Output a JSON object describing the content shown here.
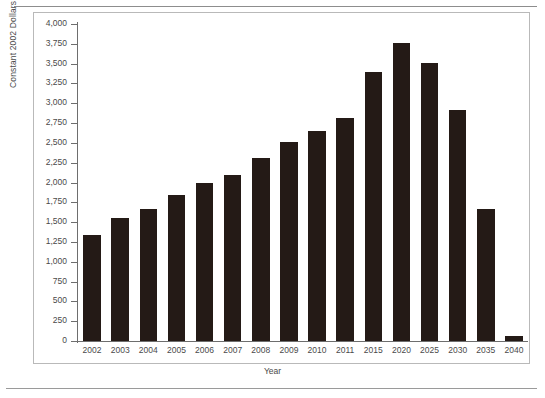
{
  "figure": {
    "background_color": "#ffffff",
    "bar_color": "#241a16",
    "axis_color": "#6e6e6e",
    "text_color": "#4a4a4a"
  },
  "axes": {
    "y_title": "Constant 2002 Dollars in Billions",
    "x_title": "Year",
    "y_ticks": [
      "4,000",
      "3,750",
      "3,500",
      "3,250",
      "3,000",
      "2,750",
      "2,500",
      "2,250",
      "2,000",
      "1,750",
      "1,500",
      "1,250",
      "1,000",
      "750",
      "500",
      "250",
      "0"
    ]
  },
  "chart_data": {
    "type": "bar",
    "title": "",
    "xlabel": "Year",
    "ylabel": "Constant 2002 Dollars in Billions",
    "ylim": [
      0,
      4000
    ],
    "ytick_interval": 250,
    "grid": false,
    "legend": false,
    "categories": [
      "2002",
      "2003",
      "2004",
      "2005",
      "2006",
      "2007",
      "2008",
      "2009",
      "2010",
      "2011",
      "2015",
      "2020",
      "2025",
      "2030",
      "2035",
      "2040"
    ],
    "values": [
      1340,
      1555,
      1660,
      1840,
      2000,
      2100,
      2305,
      2510,
      2650,
      2810,
      3400,
      3760,
      3510,
      2910,
      1660,
      60
    ]
  }
}
